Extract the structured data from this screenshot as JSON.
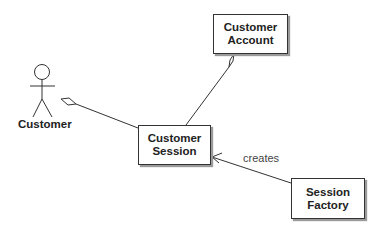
{
  "diagram": {
    "type": "UML class/association diagram",
    "actor": {
      "label": "Customer"
    },
    "classes": [
      {
        "id": "account",
        "line1": "Customer",
        "line2": "Account"
      },
      {
        "id": "session",
        "line1": "Customer",
        "line2": "Session"
      },
      {
        "id": "factory",
        "line1": "Session",
        "line2": "Factory"
      }
    ],
    "relationships": [
      {
        "from": "session",
        "to": "actor",
        "kind": "aggregation",
        "label": ""
      },
      {
        "from": "session",
        "to": "account",
        "kind": "aggregation",
        "label": ""
      },
      {
        "from": "factory",
        "to": "session",
        "kind": "dependency",
        "label": "creates"
      }
    ],
    "colors": {
      "line": "#333333",
      "box_fill": "#ffffff",
      "shadow": "#9a9a9a",
      "text": "#222222"
    }
  }
}
